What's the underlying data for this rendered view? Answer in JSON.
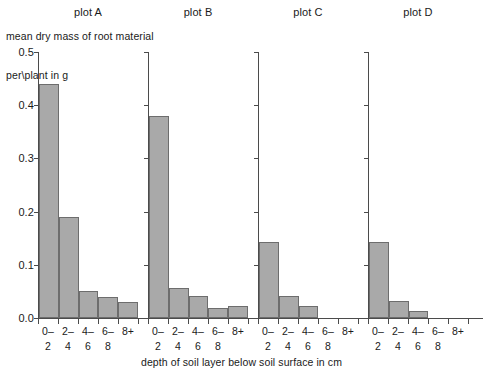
{
  "chart_data": {
    "type": "bar",
    "title": "mean dry mass of root material per\\plant in g",
    "ylabel_line1": "mean dry mass of root material",
    "ylabel_line2": "per\\plant in g",
    "xlabel": "depth of soil layer below soil surface in cm",
    "ylim": [
      0.0,
      0.5
    ],
    "grid": false,
    "legend": "none",
    "ytick_labels": [
      "0.5",
      "0.4",
      "0.3",
      "0.2",
      "0.1",
      "0.0"
    ],
    "ytick_values": [
      0.5,
      0.4,
      0.3,
      0.2,
      0.1,
      0.0
    ],
    "categories": [
      "0-2",
      "2-4",
      "4-6",
      "6-8",
      "8+"
    ],
    "category_lines": [
      {
        "top": "0–",
        "bottom": "2"
      },
      {
        "top": "2–",
        "bottom": "4"
      },
      {
        "top": "4–",
        "bottom": "6"
      },
      {
        "top": "6–",
        "bottom": "8"
      },
      {
        "top": "8+",
        "bottom": ""
      }
    ],
    "panels": [
      {
        "name": "plot A",
        "values": [
          0.44,
          0.19,
          0.05,
          0.04,
          0.03
        ]
      },
      {
        "name": "plot B",
        "values": [
          0.38,
          0.057,
          0.042,
          0.018,
          0.023
        ]
      },
      {
        "name": "plot C",
        "values": [
          0.142,
          0.042,
          0.022,
          0.0,
          0.0
        ]
      },
      {
        "name": "plot D",
        "values": [
          0.143,
          0.032,
          0.014,
          0.0,
          0.0
        ]
      }
    ],
    "colors": {
      "bar_fill": "#a9a9a9",
      "bar_edge": "#6d6d6d",
      "axis": "#4b4b4b",
      "text": "#1a1a1a",
      "background": "#ffffff"
    }
  }
}
